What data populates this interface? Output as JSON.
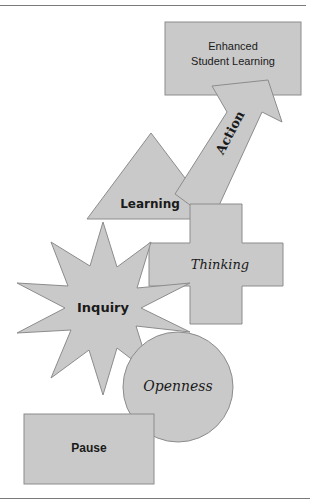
{
  "diagram": {
    "nodes": [
      {
        "id": "pause",
        "label": "Pause",
        "shape": "rectangle"
      },
      {
        "id": "openness",
        "label": "Openness",
        "shape": "circle"
      },
      {
        "id": "inquiry",
        "label": "Inquiry",
        "shape": "star"
      },
      {
        "id": "thinking",
        "label": "Thinking",
        "shape": "cross"
      },
      {
        "id": "learning",
        "label": "Learning",
        "shape": "triangle"
      },
      {
        "id": "action",
        "label": "Action",
        "shape": "arrow"
      },
      {
        "id": "outcome",
        "label_line1": "Enhanced",
        "label_line2": "Student Learning",
        "shape": "rectangle"
      }
    ],
    "colors": {
      "fill": "#c9c9c9",
      "stroke": "#8c8c8c",
      "text": "#1a1a1a"
    }
  }
}
